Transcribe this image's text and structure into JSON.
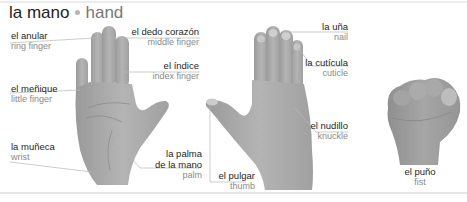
{
  "title": {
    "spanish": "la mano",
    "english": "hand"
  },
  "colors": {
    "skin": "#a9a9a9",
    "skin_dark": "#8c8c8c",
    "leader_line": "#b8b8b8",
    "label_es": "#262626",
    "label_en": "#8a8a8a",
    "separator_dot": "#b5b5b5"
  },
  "labels": {
    "ring_finger": {
      "es": "el anular",
      "en": "ring finger"
    },
    "middle_finger": {
      "es": "el dedo corazón",
      "en": "middle finger"
    },
    "index_finger": {
      "es": "el índice",
      "en": "index finger"
    },
    "little_finger": {
      "es": "el meñique",
      "en": "little finger"
    },
    "wrist": {
      "es": "la muñeca",
      "en": "wrist"
    },
    "palm": {
      "es_line1": "la palma",
      "es_line2": "de la mano",
      "en": "palm"
    },
    "thumb": {
      "es": "el pulgar",
      "en": "thumb"
    },
    "nail": {
      "es": "la uña",
      "en": "nail"
    },
    "cuticle": {
      "es": "la cutícula",
      "en": "cuticle"
    },
    "knuckle": {
      "es": "el nudillo",
      "en": "knuckle"
    },
    "fist": {
      "es": "el puño",
      "en": "fist"
    }
  }
}
